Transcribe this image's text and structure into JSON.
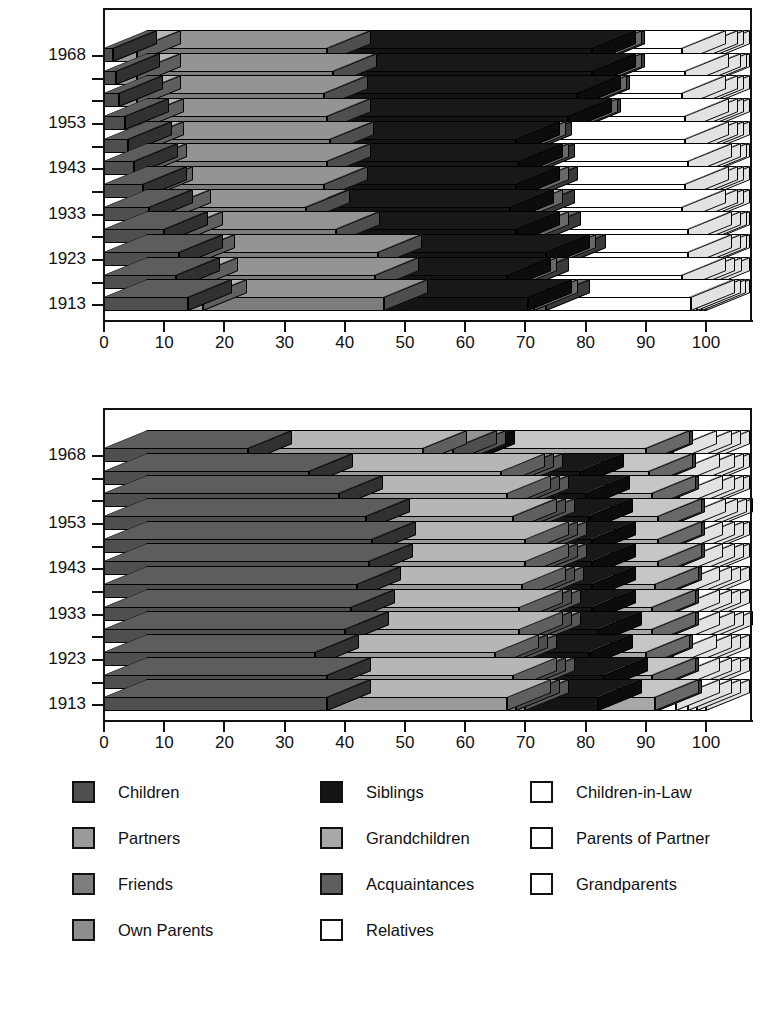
{
  "chart_data": [
    {
      "id": "top",
      "type": "bar",
      "orientation": "horizontal",
      "stacked": true,
      "title": "",
      "xlabel": "",
      "ylabel": "",
      "xlim": [
        0,
        100
      ],
      "xticks": [
        0,
        10,
        20,
        30,
        40,
        50,
        60,
        70,
        80,
        90,
        100
      ],
      "xticklabels": [
        "0",
        "10",
        "20",
        "30",
        "40",
        "50",
        "60",
        "70",
        "80",
        "90",
        "100"
      ],
      "grid": false,
      "legend_position": "below",
      "categories": [
        "1913",
        "1918",
        "1923",
        "1928",
        "1933",
        "1938",
        "1943",
        "1948",
        "1953",
        "1958",
        "1963",
        "1968"
      ],
      "visible_yticklabels": [
        "1913",
        "1923",
        "1933",
        "1943",
        "1953",
        "1968"
      ],
      "series": [
        {
          "name": "Children",
          "values": [
            14.0,
            12.0,
            12.5,
            10.0,
            7.5,
            6.5,
            5.0,
            4.0,
            3.5,
            2.5,
            2.0,
            1.5
          ]
        },
        {
          "name": "Partners",
          "values": [
            2.5,
            3.0,
            2.0,
            2.5,
            3.0,
            1.0,
            1.5,
            2.0,
            2.5,
            3.0,
            3.5,
            4.0
          ]
        },
        {
          "name": "Friends",
          "values": [
            30.0,
            30.0,
            31.0,
            26.0,
            23.0,
            29.0,
            30.5,
            31.5,
            31.0,
            31.0,
            32.5,
            31.5
          ]
        },
        {
          "name": "Own Parents",
          "values": [
            0.0,
            0.0,
            0.0,
            0.0,
            0.0,
            0.0,
            0.0,
            0.0,
            0.0,
            0.0,
            0.0,
            0.0
          ]
        },
        {
          "name": "Siblings",
          "values": [
            24.0,
            22.0,
            28.0,
            30.0,
            34.0,
            32.0,
            32.0,
            31.0,
            40.0,
            42.0,
            43.0,
            44.0
          ]
        },
        {
          "name": "Grandchildren",
          "values": [
            1.0,
            1.0,
            1.0,
            1.5,
            1.5,
            1.5,
            1.0,
            1.0,
            1.0,
            1.0,
            1.0,
            1.0
          ]
        },
        {
          "name": "Acquaintances",
          "values": [
            2.0,
            2.0,
            1.5,
            2.0,
            2.0,
            1.5,
            1.0,
            1.0,
            0.5,
            0.5,
            0.5,
            0.5
          ]
        },
        {
          "name": "Relatives",
          "values": [
            24.0,
            26.0,
            21.0,
            25.0,
            25.0,
            25.0,
            26.0,
            26.0,
            18.0,
            16.0,
            14.0,
            13.5
          ]
        },
        {
          "name": "Children-in-Law",
          "values": [
            1.0,
            1.5,
            1.5,
            1.5,
            2.0,
            1.5,
            1.5,
            1.5,
            1.5,
            2.0,
            2.0,
            2.0
          ]
        },
        {
          "name": "Parents of Partner",
          "values": [
            0.8,
            1.2,
            1.0,
            1.0,
            1.0,
            1.0,
            1.0,
            1.0,
            1.0,
            1.0,
            1.0,
            1.0
          ]
        },
        {
          "name": "Grandparents",
          "values": [
            0.7,
            1.3,
            0.5,
            0.5,
            1.0,
            1.0,
            0.5,
            1.0,
            1.0,
            1.0,
            0.5,
            1.0
          ]
        }
      ]
    },
    {
      "id": "bottom",
      "type": "bar",
      "orientation": "horizontal",
      "stacked": true,
      "title": "",
      "xlabel": "",
      "ylabel": "",
      "xlim": [
        0,
        100
      ],
      "xticks": [
        0,
        10,
        20,
        30,
        40,
        50,
        60,
        70,
        80,
        90,
        100
      ],
      "xticklabels": [
        "0",
        "10",
        "20",
        "30",
        "40",
        "50",
        "60",
        "70",
        "80",
        "90",
        "100"
      ],
      "grid": false,
      "legend_position": "below",
      "categories": [
        "1913",
        "1918",
        "1923",
        "1928",
        "1933",
        "1938",
        "1943",
        "1948",
        "1953",
        "1958",
        "1963",
        "1968"
      ],
      "visible_yticklabels": [
        "1913",
        "1923",
        "1933",
        "1943",
        "1953",
        "1968"
      ],
      "series": [
        {
          "name": "Children",
          "values": [
            37.0,
            37.0,
            35.0,
            40.0,
            41.0,
            42.0,
            44.0,
            44.5,
            43.5,
            39.0,
            34.0,
            24.0
          ]
        },
        {
          "name": "Partners",
          "values": [
            30.0,
            31.0,
            30.0,
            29.0,
            28.0,
            27.5,
            26.0,
            25.5,
            24.5,
            28.0,
            32.0,
            29.0
          ]
        },
        {
          "name": "Friends",
          "values": [
            1.5,
            1.5,
            1.5,
            1.5,
            1.5,
            1.5,
            1.5,
            1.5,
            1.5,
            1.5,
            1.5,
            5.0
          ]
        },
        {
          "name": "Own Parents",
          "values": [
            1.5,
            1.5,
            1.5,
            1.5,
            1.5,
            1.5,
            1.5,
            1.5,
            1.5,
            1.5,
            1.5,
            1.5
          ]
        },
        {
          "name": "Siblings",
          "values": [
            12.0,
            12.0,
            12.5,
            10.0,
            9.0,
            8.5,
            8.0,
            8.0,
            9.5,
            10.0,
            10.0,
            1.5
          ]
        },
        {
          "name": "Grandchildren",
          "values": [
            9.5,
            8.0,
            9.5,
            9.0,
            10.0,
            10.5,
            11.0,
            11.0,
            11.5,
            11.0,
            11.5,
            29.0
          ]
        },
        {
          "name": "Acquaintances",
          "values": [
            0.5,
            0.5,
            0.5,
            0.5,
            0.5,
            0.5,
            0.5,
            0.5,
            0.5,
            0.5,
            0.5,
            0.5
          ]
        },
        {
          "name": "Relatives",
          "values": [
            3.0,
            3.5,
            4.0,
            3.5,
            3.5,
            3.0,
            3.0,
            3.0,
            3.5,
            4.0,
            4.0,
            4.0
          ]
        },
        {
          "name": "Children-in-Law",
          "values": [
            2.0,
            2.0,
            2.5,
            2.5,
            2.0,
            2.0,
            2.0,
            2.0,
            2.0,
            2.0,
            2.5,
            2.5
          ]
        },
        {
          "name": "Parents of Partner",
          "values": [
            1.5,
            1.5,
            1.5,
            1.5,
            1.5,
            1.5,
            1.5,
            1.5,
            1.5,
            1.5,
            1.5,
            1.5
          ]
        },
        {
          "name": "Grandparents",
          "values": [
            1.5,
            1.5,
            1.5,
            1.5,
            1.5,
            1.5,
            1.0,
            1.0,
            1.0,
            1.0,
            1.0,
            1.5
          ]
        }
      ]
    }
  ],
  "legend": {
    "columns": [
      [
        {
          "label": "Children",
          "color": "#4f4f4f",
          "swatch": "filled"
        },
        {
          "label": "Partners",
          "color": "#9a9a9a",
          "swatch": "filled"
        },
        {
          "label": "Friends",
          "color": "#7d7d7d",
          "swatch": "filled"
        },
        {
          "label": "Own Parents",
          "color": "#8d8d8d",
          "swatch": "filled"
        }
      ],
      [
        {
          "label": "Siblings",
          "color": "#141414",
          "swatch": "filled"
        },
        {
          "label": "Grandchildren",
          "color": "#a8a8a8",
          "swatch": "filled"
        },
        {
          "label": "Acquaintances",
          "color": "#5e5e5e",
          "swatch": "filled"
        },
        {
          "label": "Relatives",
          "color": "#ffffff",
          "swatch": "outline"
        }
      ],
      [
        {
          "label": "Children-in-Law",
          "color": "#ffffff",
          "swatch": "outline"
        },
        {
          "label": "Parents of Partner",
          "color": "#ffffff",
          "swatch": "outline"
        },
        {
          "label": "Grandparents",
          "color": "#ffffff",
          "swatch": "outline"
        }
      ]
    ]
  },
  "palette": {
    "Children": "#4f4f4f",
    "Partners": "#9a9a9a",
    "Friends": "#7d7d7d",
    "Own Parents": "#8d8d8d",
    "Siblings": "#141414",
    "Grandchildren": "#a8a8a8",
    "Acquaintances": "#5e5e5e",
    "Relatives": "#ffffff",
    "Children-in-Law": "#ffffff",
    "Parents of Partner": "#ffffff",
    "Grandparents": "#ffffff"
  }
}
